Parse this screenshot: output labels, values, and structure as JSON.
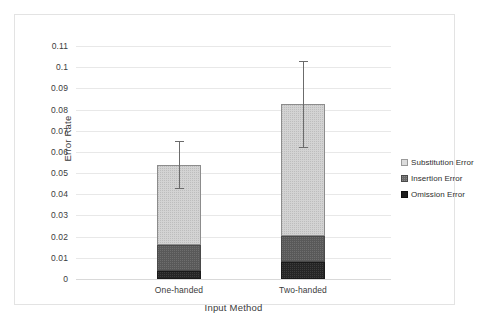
{
  "chart_data": {
    "type": "bar",
    "title": "",
    "subtitle": "",
    "xlabel": "Input Method",
    "ylabel": "Error Rate",
    "categories": [
      "One-handed",
      "Two-handed"
    ],
    "stacked": true,
    "grid": true,
    "legend_position": "right",
    "ylim": [
      0,
      0.11
    ],
    "yticks": [
      "0",
      "0.01",
      "0.02",
      "0.03",
      "0.04",
      "0.05",
      "0.06",
      "0.07",
      "0.08",
      "0.09",
      "0.1",
      "0.11"
    ],
    "ytick_values": [
      0,
      0.01,
      0.02,
      0.03,
      0.04,
      0.05,
      0.06,
      0.07,
      0.08,
      0.09,
      0.1,
      0.11
    ],
    "series": [
      {
        "name": "Omission Error",
        "color": "#262626",
        "values": [
          0.004,
          0.008
        ]
      },
      {
        "name": "Insertion Error",
        "color": "#595959",
        "values": [
          0.012,
          0.0125
        ]
      },
      {
        "name": "Substitution Error",
        "color": "#d3d3d3",
        "values": [
          0.038,
          0.062
        ]
      }
    ],
    "stack_totals": [
      0.054,
      0.0825
    ],
    "error_bars": [
      {
        "category": "One-handed",
        "total": 0.054,
        "upper": 0.065,
        "lower": 0.0425
      },
      {
        "category": "Two-handed",
        "total": 0.0825,
        "upper": 0.103,
        "lower": 0.062
      }
    ],
    "legend": [
      "Substitution Error",
      "Insertion Error",
      "Omission Error"
    ]
  },
  "legend": {
    "items": [
      {
        "label": "Substitution Error",
        "swatch": "substitution"
      },
      {
        "label": "Insertion Error",
        "swatch": "insertion"
      },
      {
        "label": "Omission Error",
        "swatch": "omission"
      }
    ]
  },
  "axes": {
    "y_title": "Error Rate",
    "x_title": "Input Method"
  }
}
